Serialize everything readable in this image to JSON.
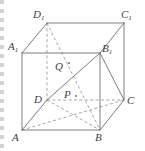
{
  "figure": {
    "kind": "geometry-diagram",
    "shape_name": "rectangular prism ABCD-A1B1C1D1",
    "stroke_color": "#6b6f72",
    "dashed_color": "#8b8f92",
    "label_color": "#3c3f42",
    "background": "#ffffff",
    "width": 145,
    "height": 151
  },
  "labels": {
    "D1": {
      "base": "D",
      "sub": "1"
    },
    "C1": {
      "base": "C",
      "sub": "1"
    },
    "A1": {
      "base": "A",
      "sub": "1"
    },
    "B1": {
      "base": "B",
      "sub": "1"
    },
    "D": {
      "base": "D",
      "sub": ""
    },
    "C": {
      "base": "C",
      "sub": ""
    },
    "A": {
      "base": "A",
      "sub": ""
    },
    "B": {
      "base": "B",
      "sub": ""
    },
    "P": {
      "base": "P",
      "sub": ""
    },
    "Q": {
      "base": "Q",
      "sub": ""
    }
  },
  "vertices": {
    "A1": {
      "x": 22,
      "y": 53
    },
    "B1": {
      "x": 100,
      "y": 53
    },
    "C1": {
      "x": 124,
      "y": 23
    },
    "D1": {
      "x": 47,
      "y": 23
    },
    "A": {
      "x": 22,
      "y": 130
    },
    "B": {
      "x": 100,
      "y": 130
    },
    "C": {
      "x": 124,
      "y": 100
    },
    "D": {
      "x": 47,
      "y": 100
    },
    "P": {
      "x": 76,
      "y": 97
    },
    "Q": {
      "x": 68,
      "y": 64
    }
  },
  "edges_solid": [
    {
      "from": "A1",
      "to": "B1"
    },
    {
      "from": "B1",
      "to": "C1"
    },
    {
      "from": "C1",
      "to": "D1"
    },
    {
      "from": "D1",
      "to": "A1"
    },
    {
      "from": "A",
      "to": "B"
    },
    {
      "from": "B",
      "to": "C"
    },
    {
      "from": "A",
      "to": "A1"
    },
    {
      "from": "B",
      "to": "B1"
    },
    {
      "from": "C",
      "to": "C1"
    },
    {
      "from": "A",
      "to": "D"
    },
    {
      "from": "D",
      "to": "B1"
    },
    {
      "from": "B1",
      "to": "C"
    }
  ],
  "edges_dashed": [
    {
      "from": "D1",
      "to": "D"
    },
    {
      "from": "D",
      "to": "C"
    },
    {
      "from": "D",
      "to": "B"
    },
    {
      "from": "A",
      "to": "C"
    },
    {
      "from": "D1",
      "to": "B"
    }
  ],
  "marked_points": [
    {
      "name": "P",
      "x": 76,
      "y": 97
    },
    {
      "name": "Q",
      "x": 68,
      "y": 64
    }
  ]
}
